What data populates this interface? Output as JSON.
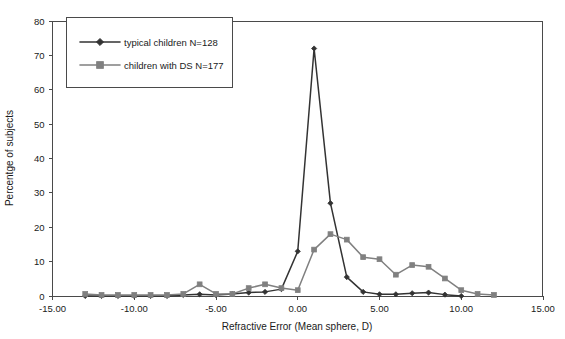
{
  "chart_data": {
    "type": "line",
    "title": "",
    "xlabel": "Refractive Error (Mean sphere, D)",
    "ylabel": "Percentge of subjects",
    "xlim": [
      -15,
      15
    ],
    "ylim": [
      0,
      80
    ],
    "grid": false,
    "legend_position": "top-left",
    "xticks": [
      -15,
      -10,
      -5,
      0,
      5,
      10,
      15
    ],
    "xtick_labels": [
      "-15.00",
      "-10.00",
      "-5.00",
      "0.00",
      "5.00",
      "10.00",
      "15.00"
    ],
    "yticks": [
      0,
      10,
      20,
      30,
      40,
      50,
      60,
      70,
      80
    ],
    "ytick_labels": [
      "0",
      "10",
      "20",
      "30",
      "40",
      "50",
      "60",
      "70",
      "80"
    ],
    "series": [
      {
        "name": "typical children N=128",
        "color": "#333333",
        "marker": "diamond",
        "x": [
          -13,
          -12,
          -11,
          -10,
          -9,
          -8,
          -7,
          -6,
          -5,
          -4,
          -3,
          -2,
          -1,
          0,
          1,
          2,
          3,
          4,
          5,
          6,
          7,
          8,
          9,
          10
        ],
        "values": [
          0,
          0,
          0,
          0,
          0,
          0,
          0.3,
          0.5,
          0.3,
          0.6,
          1.0,
          1.2,
          2.0,
          13.0,
          72.0,
          27.0,
          5.5,
          1.2,
          0.5,
          0.5,
          0.8,
          1.0,
          0.4,
          0
        ]
      },
      {
        "name": "children with DS N=177",
        "color": "#808080",
        "marker": "square",
        "x": [
          -13,
          -12,
          -11,
          -10,
          -9,
          -8,
          -7,
          -6,
          -5,
          -4,
          -3,
          -2,
          -1,
          0,
          1,
          2,
          3,
          4,
          5,
          6,
          7,
          8,
          9,
          10,
          11,
          12
        ],
        "values": [
          0.6,
          0.3,
          0.3,
          0.3,
          0.3,
          0.3,
          0.6,
          3.4,
          0.6,
          0.6,
          2.3,
          3.4,
          2.3,
          1.7,
          13.5,
          18.0,
          16.4,
          11.3,
          10.7,
          6.2,
          9.0,
          8.5,
          5.1,
          1.7,
          0.6,
          0.3
        ]
      }
    ]
  },
  "legend": {
    "entries": [
      {
        "label": "typical children N=128"
      },
      {
        "label": "children with DS N=177"
      }
    ]
  },
  "axes": {
    "x_title": "Refractive Error (Mean sphere, D)",
    "y_title": "Percentge of subjects"
  }
}
